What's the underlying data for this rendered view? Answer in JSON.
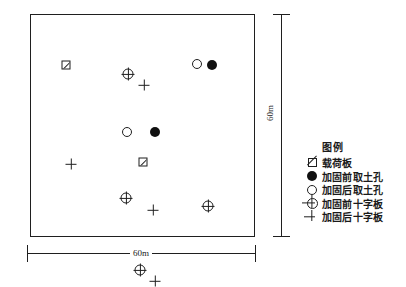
{
  "figure": {
    "title": "",
    "plan": {
      "width_label": "60m",
      "height_label": "60m",
      "box": {
        "x": 30,
        "y": 14,
        "w": 225,
        "h": 223
      }
    },
    "markers": [
      {
        "id": "plate-upper-left",
        "type": "load-plate",
        "x": 66,
        "y": 65
      },
      {
        "id": "vane-before-top",
        "type": "vane-before",
        "x": 128,
        "y": 65
      },
      {
        "id": "vane-after-top",
        "type": "vane-after",
        "x": 144,
        "y": 65
      },
      {
        "id": "hole-after-top",
        "type": "hole-after",
        "x": 197,
        "y": 64
      },
      {
        "id": "hole-before-top",
        "type": "hole-before",
        "x": 212,
        "y": 65
      },
      {
        "id": "vane-after-left",
        "type": "vane-after",
        "x": 71,
        "y": 133
      },
      {
        "id": "plate-center",
        "type": "load-plate",
        "x": 143,
        "y": 120
      },
      {
        "id": "hole-after-center",
        "type": "hole-after",
        "x": 127,
        "y": 132
      },
      {
        "id": "hole-before-center",
        "type": "hole-before",
        "x": 155,
        "y": 132
      },
      {
        "id": "vane-before-center",
        "type": "vane-before",
        "x": 126,
        "y": 147
      },
      {
        "id": "vane-after-center",
        "type": "vane-after",
        "x": 153,
        "y": 148
      },
      {
        "id": "vane-before-right",
        "type": "vane-before",
        "x": 208,
        "y": 133
      },
      {
        "id": "vane-before-bottom",
        "type": "vane-before",
        "x": 140,
        "y": 186
      },
      {
        "id": "vane-after-bottom",
        "type": "vane-after",
        "x": 155,
        "y": 186
      }
    ],
    "legend": {
      "title": "图例",
      "items": [
        {
          "symbol": "load-plate",
          "label": "载荷板"
        },
        {
          "symbol": "hole-before",
          "label": "加固前取土孔"
        },
        {
          "symbol": "hole-after",
          "label": "加固后取土孔"
        },
        {
          "symbol": "vane-before",
          "label": "加固前十字板"
        },
        {
          "symbol": "vane-after",
          "label": "加固后十字板"
        }
      ]
    }
  },
  "chart_data": {
    "type": "scatter",
    "title": "",
    "subtitle": "",
    "xlabel": "60m",
    "ylabel": "60m",
    "xlim": [
      0,
      60
    ],
    "ylim": [
      0,
      60
    ],
    "grid": false,
    "legend_position": "right",
    "legend_title": "图例",
    "series": [
      {
        "name": "载荷板",
        "symbol": "load-plate",
        "points": [
          {
            "x": 9.6,
            "y": 46.1
          },
          {
            "x": 30.1,
            "y": 52.0
          }
        ]
      },
      {
        "name": "加固前取土孔",
        "symbol": "hole-before",
        "points": [
          {
            "x": 48.5,
            "y": 46.1
          },
          {
            "x": 33.3,
            "y": 38.6
          }
        ]
      },
      {
        "name": "加固后取土孔",
        "symbol": "hole-after",
        "points": [
          {
            "x": 44.5,
            "y": 46.4
          },
          {
            "x": 25.9,
            "y": 38.6
          }
        ]
      },
      {
        "name": "加固前十字板",
        "symbol": "vane-before",
        "points": [
          {
            "x": 26.1,
            "y": 46.1
          },
          {
            "x": 25.6,
            "y": 34.6
          },
          {
            "x": 47.5,
            "y": 36.3
          },
          {
            "x": 29.3,
            "y": 24.0
          }
        ]
      },
      {
        "name": "加固后十字板",
        "symbol": "vane-after",
        "points": [
          {
            "x": 30.4,
            "y": 46.1
          },
          {
            "x": 10.9,
            "y": 36.3
          },
          {
            "x": 32.8,
            "y": 34.4
          },
          {
            "x": 33.3,
            "y": 24.0
          }
        ]
      }
    ]
  }
}
